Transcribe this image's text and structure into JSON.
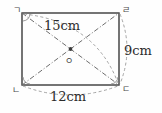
{
  "figure": {
    "type": "rectangle-with-diagonals",
    "shape_name": "rectangle",
    "stroke_color": "#3a3a3a",
    "dash_color": "#8a8a8a",
    "background_color": "#fefefe",
    "rect": {
      "x": 22,
      "y": 13,
      "width": 97,
      "height": 72
    },
    "vertices": [
      {
        "id": "top-left",
        "label": "ㄱ",
        "x": 22,
        "y": 13
      },
      {
        "id": "top-right",
        "label": "ㄹ",
        "x": 119,
        "y": 13
      },
      {
        "id": "bottom-right",
        "label": "ㄷ",
        "x": 119,
        "y": 85
      },
      {
        "id": "bottom-left",
        "label": "ㄴ",
        "x": 22,
        "y": 85
      }
    ],
    "center": {
      "id": "center-point",
      "label": "ㅇ",
      "x": 70.5,
      "y": 49
    },
    "measurements": [
      {
        "id": "diagonal",
        "value": "15",
        "unit": "cm",
        "text": "15cm",
        "applies_to": "diagonal-top-left-to-bottom-right"
      },
      {
        "id": "right-side",
        "value": "9",
        "unit": "cm",
        "text": "9cm",
        "applies_to": "right-edge"
      },
      {
        "id": "bottom-side",
        "value": "12",
        "unit": "cm",
        "text": "12cm",
        "applies_to": "bottom-edge"
      }
    ],
    "right_angle_markers": [
      "top-left-interior",
      "bottom-left-interior",
      "bottom-right-interior"
    ]
  }
}
